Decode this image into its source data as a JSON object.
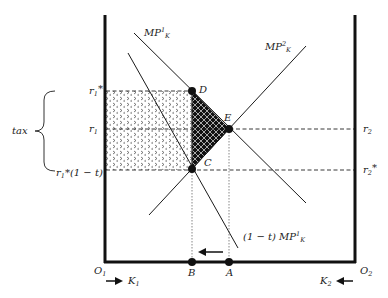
{
  "diagram": {
    "type": "two-country capital allocation (tax incidence)",
    "curves": [
      {
        "id": "mp1k",
        "label": "MP",
        "sup": "1",
        "sub": "K"
      },
      {
        "id": "mp2k",
        "label": "MP",
        "sup": "2",
        "sub": "K"
      },
      {
        "id": "mp1k_taxed",
        "label_prefix": "(1 − t) MP",
        "sup": "1",
        "sub": "K"
      }
    ],
    "points": {
      "D": "D",
      "E": "E",
      "C": "C",
      "B": "B",
      "A": "A"
    },
    "left_axis_labels": {
      "r1_star": {
        "base": "r",
        "sub": "1",
        "suffix": "*"
      },
      "r1": {
        "base": "r",
        "sub": "1"
      },
      "r1_star_1mt": {
        "base": "r",
        "sub": "1",
        "suffix": "*(1 − t)"
      }
    },
    "right_axis_labels": {
      "r2": {
        "base": "r",
        "sub": "2"
      },
      "r2_star": {
        "base": "r",
        "sub": "2",
        "suffix": "*"
      }
    },
    "brace_label": "tax",
    "origins": {
      "O1": {
        "base": "O",
        "sub": "1"
      },
      "O2": {
        "base": "O",
        "sub": "2"
      }
    },
    "capital": {
      "K1": {
        "base": "K",
        "sub": "1"
      },
      "K2": {
        "base": "K",
        "sub": "2"
      }
    },
    "colors": {
      "line": "#1a1a1a",
      "axis": "#111111",
      "fill_dark": "#111111"
    }
  }
}
